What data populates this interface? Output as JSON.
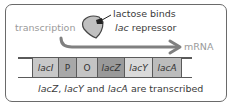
{
  "labels": {
    "transcription": "transcription",
    "lactose_line1": "lactose binds",
    "lactose_line2_italic": "lac",
    "lactose_line2_rest": " repressor",
    "mrna": "mRNA",
    "caption": "lacZ, lacY and lacA are transcribed"
  },
  "caption_parts": {
    "p1": "lacZ",
    "p2": ", ",
    "p3": "lacY",
    "p4": " and ",
    "p5": "lacA",
    "p6": " are transcribed"
  },
  "genes": [
    {
      "label": "lacI",
      "italic": true,
      "color": "#c8c8c8"
    },
    {
      "label": "P",
      "italic": false,
      "color": "#a8a8a8"
    },
    {
      "label": "O",
      "italic": false,
      "color": "#c4c4c4"
    },
    {
      "label": "lacZ",
      "italic": true,
      "color": "#9a9a9a"
    },
    {
      "label": "lacY",
      "italic": true,
      "color": "#dadada"
    },
    {
      "label": "lacA",
      "italic": true,
      "color": "#bcbcbc"
    }
  ],
  "colors": {
    "arrow": "#808080",
    "frame": "#6a6a6a",
    "repressor_fill": "#c0c0c0"
  }
}
